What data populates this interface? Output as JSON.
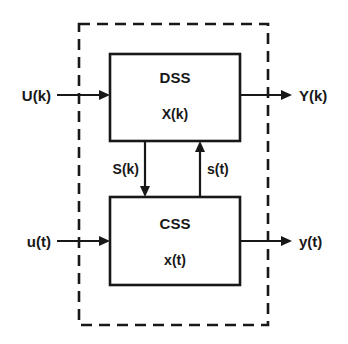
{
  "diagram": {
    "colors": {
      "ink": "#181818",
      "background": "#ffffff"
    },
    "boundary": {
      "name": "system-boundary",
      "style": "dashed"
    },
    "blocks": [
      {
        "id": "dss",
        "title": "DSS",
        "state": "X(k)"
      },
      {
        "id": "css",
        "title": "CSS",
        "state": "x(t)"
      }
    ],
    "signals": {
      "input_discrete": "U(k)",
      "output_discrete": "Y(k)",
      "input_continuous": "u(t)",
      "output_continuous": "y(t)",
      "dss_to_css": "S(k)",
      "css_to_dss": "s(t)"
    }
  }
}
